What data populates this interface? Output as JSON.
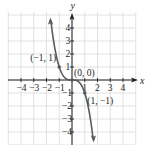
{
  "chart_data": {
    "type": "line",
    "title": "",
    "function": "y = -x^3",
    "xlabel": "x",
    "ylabel": "y",
    "xlim": [
      -5,
      5
    ],
    "ylim": [
      -5,
      5
    ],
    "grid": true,
    "x_ticks": [
      -4,
      -3,
      -2,
      -1,
      1,
      2,
      3,
      4
    ],
    "x_tick_labels": [
      "−4",
      "−3",
      "−2",
      "−1",
      "1",
      "2",
      "3",
      "4"
    ],
    "y_ticks": [
      4,
      3,
      2,
      1,
      -1,
      -2,
      -3,
      -4
    ],
    "y_tick_labels": [
      "4",
      "3",
      "2",
      "1",
      "−1",
      "−2",
      "−3",
      "−4"
    ],
    "series": [
      {
        "name": "y = -x^3",
        "x": [
          -1.65,
          -1.5,
          -1.25,
          -1,
          -0.75,
          -0.5,
          -0.25,
          0,
          0.25,
          0.5,
          0.75,
          1,
          1.25,
          1.5,
          1.65
        ],
        "y": [
          4.49,
          3.375,
          1.953,
          1,
          0.422,
          0.125,
          0.016,
          0,
          -0.016,
          -0.125,
          -0.422,
          -1,
          -1.953,
          -3.375,
          -4.49
        ]
      }
    ],
    "points": [
      {
        "x": -1,
        "y": 1,
        "label": "(−1, 1)"
      },
      {
        "x": 0,
        "y": 0,
        "label": "(0, 0)"
      },
      {
        "x": 1,
        "y": -1,
        "label": "(1, −1)"
      }
    ],
    "colors": {
      "curve": "#5a5b5d",
      "axis": "#231f20",
      "grid": "#d9d9d9",
      "text": "#231f20"
    }
  }
}
